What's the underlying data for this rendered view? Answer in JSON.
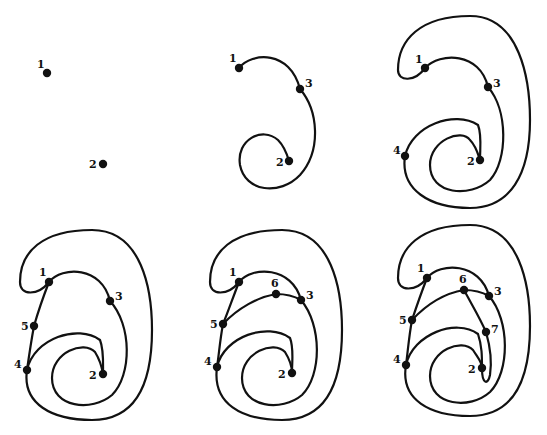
{
  "figure": {
    "stroke_color": "#111111",
    "background": "#ffffff",
    "top_caption_fragment": "",
    "panels": [
      {
        "id": "panel-1",
        "nodes": [
          {
            "label": "1",
            "x": 47,
            "y": 73,
            "lx": 37,
            "ly": 68
          },
          {
            "label": "2",
            "x": 103,
            "y": 164,
            "lx": 89,
            "ly": 168
          }
        ],
        "edges": []
      },
      {
        "id": "panel-2",
        "nodes": [
          {
            "label": "1",
            "x": 239,
            "y": 68,
            "lx": 229,
            "ly": 62
          },
          {
            "label": "3",
            "x": 300,
            "y": 89,
            "lx": 305,
            "ly": 87
          },
          {
            "label": "2",
            "x": 289,
            "y": 161,
            "lx": 276,
            "ly": 166
          }
        ],
        "edges": [
          "M239,68 C252,52 290,50 300,89",
          "M300,89 C318,110 322,150 300,175 C280,196 245,192 240,165 C236,140 262,126 278,140 C284,146 287,154 289,161"
        ]
      },
      {
        "id": "panel-3",
        "nodes": [
          {
            "label": "1",
            "x": 425,
            "y": 68,
            "lx": 415,
            "ly": 63
          },
          {
            "label": "3",
            "x": 488,
            "y": 87,
            "lx": 493,
            "ly": 87
          },
          {
            "label": "4",
            "x": 405,
            "y": 156,
            "lx": 393,
            "ly": 154
          },
          {
            "label": "2",
            "x": 480,
            "y": 160,
            "lx": 467,
            "ly": 165
          }
        ],
        "edges": [
          "M425,68 C440,52 480,52 488,87",
          "M488,87 C508,110 508,160 490,180 C470,198 430,195 430,165 C430,140 462,128 470,140 C476,146 478,154 480,160",
          "M425,68 C415,82 398,82 398,70 C398,40 420,16 470,16 C520,16 530,80 530,120 C530,175 510,208 470,208 C430,208 400,190 405,156",
          "M405,156 C412,125 455,110 478,125 C482,135 480,148 480,160"
        ]
      },
      {
        "id": "panel-4",
        "nodes": [
          {
            "label": "1",
            "x": 49,
            "y": 282,
            "lx": 39,
            "ly": 276
          },
          {
            "label": "3",
            "x": 110,
            "y": 301,
            "lx": 115,
            "ly": 300
          },
          {
            "label": "5",
            "x": 34,
            "y": 326,
            "lx": 21,
            "ly": 330
          },
          {
            "label": "4",
            "x": 27,
            "y": 370,
            "lx": 14,
            "ly": 368
          },
          {
            "label": "2",
            "x": 103,
            "y": 374,
            "lx": 89,
            "ly": 379
          }
        ],
        "edges": [
          "M49,282 C62,266 102,266 110,301",
          "M110,301 C132,325 132,375 112,395 C92,412 52,408 52,378 C52,352 84,340 95,352 C100,360 102,368 103,374",
          "M49,282 C38,296 20,296 20,282 C20,252 42,230 92,230 C142,230 152,290 152,330 C152,390 132,420 92,420 C52,420 22,404 27,370",
          "M49,282 C42,300 38,312 34,326 C31,342 29,356 27,370",
          "M27,370 C34,338 78,324 100,340 C104,350 103,362 103,374"
        ]
      },
      {
        "id": "panel-5",
        "nodes": [
          {
            "label": "1",
            "x": 239,
            "y": 282,
            "lx": 229,
            "ly": 276
          },
          {
            "label": "6",
            "x": 276,
            "y": 294,
            "lx": 271,
            "ly": 287
          },
          {
            "label": "3",
            "x": 301,
            "y": 300,
            "lx": 306,
            "ly": 299
          },
          {
            "label": "5",
            "x": 223,
            "y": 324,
            "lx": 210,
            "ly": 328
          },
          {
            "label": "4",
            "x": 217,
            "y": 367,
            "lx": 204,
            "ly": 365
          },
          {
            "label": "2",
            "x": 292,
            "y": 373,
            "lx": 278,
            "ly": 378
          }
        ],
        "edges": [
          "M239,282 C252,266 292,266 301,300",
          "M301,300 C322,325 322,375 302,395 C282,412 242,408 242,378 C242,352 274,340 285,352 C290,360 292,366 292,373",
          "M239,282 C228,296 210,296 210,282 C210,252 232,230 282,230 C332,230 342,290 342,330 C342,390 322,420 282,420 C242,420 212,404 217,367",
          "M239,282 C232,300 228,312 223,324 C220,340 219,354 217,367",
          "M217,367 C224,336 268,322 290,338 C294,348 292,360 292,373",
          "M223,324 C238,308 258,297 276,294 C286,294 294,296 301,300"
        ]
      },
      {
        "id": "panel-6",
        "nodes": [
          {
            "label": "1",
            "x": 427,
            "y": 278,
            "lx": 417,
            "ly": 272
          },
          {
            "label": "6",
            "x": 464,
            "y": 290,
            "lx": 459,
            "ly": 283
          },
          {
            "label": "3",
            "x": 489,
            "y": 296,
            "lx": 494,
            "ly": 295
          },
          {
            "label": "5",
            "x": 412,
            "y": 320,
            "lx": 399,
            "ly": 324
          },
          {
            "label": "7",
            "x": 486,
            "y": 332,
            "lx": 491,
            "ly": 333
          },
          {
            "label": "4",
            "x": 406,
            "y": 365,
            "lx": 393,
            "ly": 363
          },
          {
            "label": "2",
            "x": 482,
            "y": 368,
            "lx": 468,
            "ly": 373
          }
        ],
        "edges": [
          "M427,278 C440,262 480,262 489,296",
          "M489,296 C510,320 510,372 490,392 C470,410 430,406 430,376 C430,350 462,338 473,350 C478,358 482,362 482,368",
          "M427,278 C416,292 398,292 398,278 C398,248 420,225 470,225 C520,225 530,286 530,326 C530,386 510,416 470,416 C430,416 400,400 406,365",
          "M427,278 C420,296 416,308 412,320 C409,336 408,350 406,365",
          "M406,365 C413,334 456,318 478,334 C482,346 482,356 482,368",
          "M412,320 C427,304 446,293 464,290 C474,290 482,292 489,296",
          "M464,290 C472,305 480,318 486,332 C490,346 492,362 490,375 C488,385 482,385 482,368"
        ]
      }
    ]
  }
}
